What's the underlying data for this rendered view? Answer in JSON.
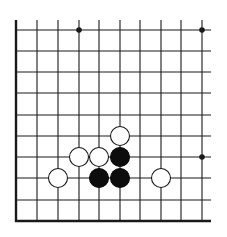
{
  "diagram": {
    "type": "go-board-fragment",
    "background": "#ffffff",
    "line_color": "#1a1a1a",
    "grid": {
      "columns_x": [
        16,
        37,
        58,
        79,
        99,
        120,
        140,
        161,
        181,
        202
      ],
      "rows_y": [
        30,
        51,
        72,
        93,
        115,
        136,
        157,
        178,
        200,
        221
      ],
      "edges": {
        "left": true,
        "bottom": true,
        "top": false,
        "right": false
      },
      "extend_top_to": 20,
      "extend_right_to": 211
    },
    "star_points": [
      {
        "col": 3,
        "row": 0
      },
      {
        "col": 9,
        "row": 0
      },
      {
        "col": 9,
        "row": 6
      }
    ],
    "stones": [
      {
        "color": "white",
        "col": 5,
        "row": 5
      },
      {
        "color": "white",
        "col": 3,
        "row": 6
      },
      {
        "color": "white",
        "col": 4,
        "row": 6
      },
      {
        "color": "black",
        "col": 5,
        "row": 6
      },
      {
        "color": "white",
        "col": 2,
        "row": 7
      },
      {
        "color": "black",
        "col": 4,
        "row": 7
      },
      {
        "color": "black",
        "col": 5,
        "row": 7
      },
      {
        "color": "white",
        "col": 7,
        "row": 7
      }
    ],
    "stone_radius": 9.5,
    "colors": {
      "black_stone": "#0d0d0d",
      "white_stone": "#ffffff",
      "white_outline": "#1a1a1a"
    }
  }
}
